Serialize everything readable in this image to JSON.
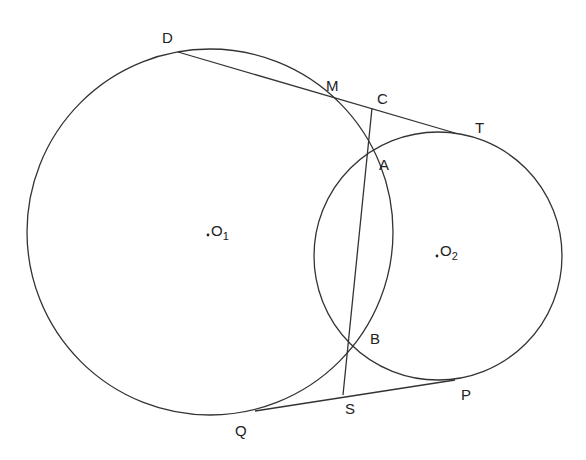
{
  "diagram": {
    "title": "",
    "stroke_color": "#333333",
    "circles": [
      {
        "name": "circle-O1",
        "center_label": "O",
        "center_sub": "1",
        "cx": 210,
        "cy": 232,
        "r": 183
      },
      {
        "name": "circle-O2",
        "center_label": "O",
        "center_sub": "2",
        "cx": 438,
        "cy": 256,
        "r": 124
      }
    ],
    "points": {
      "D": {
        "label": "D",
        "x": 178,
        "y": 52
      },
      "M": {
        "label": "M",
        "x": 323,
        "y": 94
      },
      "C": {
        "label": "C",
        "x": 372,
        "y": 108
      },
      "T": {
        "label": "T",
        "x": 455,
        "y": 133
      },
      "A": {
        "label": "A",
        "x": 368,
        "y": 153
      },
      "B": {
        "label": "B",
        "x": 349,
        "y": 341
      },
      "S": {
        "label": "S",
        "x": 343,
        "y": 395
      },
      "P": {
        "label": "P",
        "x": 455,
        "y": 380
      },
      "Q": {
        "label": "Q",
        "x": 255,
        "y": 411
      }
    },
    "segments": [
      {
        "name": "segment-DT",
        "from": "D",
        "to": "T"
      },
      {
        "name": "segment-QP",
        "from": "Q",
        "to": "P"
      },
      {
        "name": "segment-CS",
        "from": "C",
        "to": "S"
      }
    ]
  }
}
